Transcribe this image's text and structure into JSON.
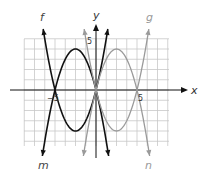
{
  "chart_data": {
    "type": "line",
    "title": "",
    "xlabel": "x",
    "ylabel": "y",
    "x_tick_labels": [
      {
        "value": -5,
        "label": "−5"
      },
      {
        "value": 5,
        "label": "5"
      }
    ],
    "y_tick_labels": [
      {
        "value": 5,
        "label": "5"
      }
    ],
    "grid": true,
    "grid_step": 1.25,
    "xlim": [
      -8.75,
      8.75
    ],
    "ylim": [
      -7,
      6.25
    ],
    "series": [
      {
        "name": "f",
        "color": "#111111",
        "equation": "0.8x(x+5)",
        "a": 0.8,
        "roots": [
          -5,
          0
        ],
        "vertex": [
          -2.5,
          -5
        ],
        "label_pos": "top-left",
        "x_range": [
          -6.6,
          1.5
        ]
      },
      {
        "name": "m",
        "color": "#111111",
        "equation": "-0.8x(x+5)",
        "a": -0.8,
        "roots": [
          -5,
          0
        ],
        "vertex": [
          -2.5,
          5
        ],
        "label_pos": "bottom-left",
        "x_range": [
          -6.6,
          1.5
        ]
      },
      {
        "name": "g",
        "color": "#9a9a9a",
        "equation": "0.8x(x-5)",
        "a": 0.8,
        "roots": [
          0,
          5
        ],
        "vertex": [
          2.5,
          -5
        ],
        "label_pos": "top-right",
        "x_range": [
          -1.5,
          6.6
        ]
      },
      {
        "name": "n",
        "color": "#9a9a9a",
        "equation": "-0.8x(x-5)",
        "a": -0.8,
        "roots": [
          0,
          5
        ],
        "vertex": [
          2.5,
          5
        ],
        "label_pos": "bottom-right",
        "x_range": [
          -1.5,
          6.6
        ]
      }
    ]
  },
  "labels": {
    "f": "f",
    "g": "g",
    "m": "m",
    "n": "n",
    "x_axis": "x",
    "y_axis": "y",
    "x_neg5": "−5",
    "x_pos5": "5",
    "y_pos5": "5"
  },
  "colors": {
    "black_curve": "#111111",
    "gray_curve": "#9a9a9a",
    "grid": "#c8c8c8",
    "axis": "#111111"
  }
}
